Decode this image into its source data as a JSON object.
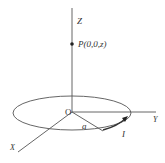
{
  "diagram": {
    "labels": {
      "z_axis": "Z",
      "y_axis": "Y",
      "x_axis": "X",
      "origin": "O",
      "point": "P(0,0,z)",
      "radius": "a",
      "current": "I"
    },
    "colors": {
      "line": "#555555",
      "text": "#333333",
      "point": "#222222"
    }
  }
}
